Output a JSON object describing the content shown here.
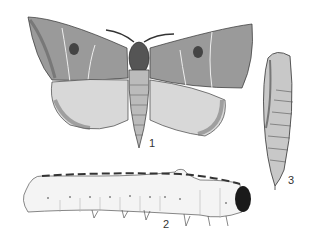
{
  "figure": {
    "panels": [
      {
        "id": "adult-moth",
        "label": "1"
      },
      {
        "id": "larva",
        "label": "2"
      },
      {
        "id": "pupa",
        "label": "3"
      }
    ],
    "colors": {
      "ink": "#2a2a2a",
      "paper": "#ffffff",
      "shade": "#8a8a8a"
    }
  }
}
